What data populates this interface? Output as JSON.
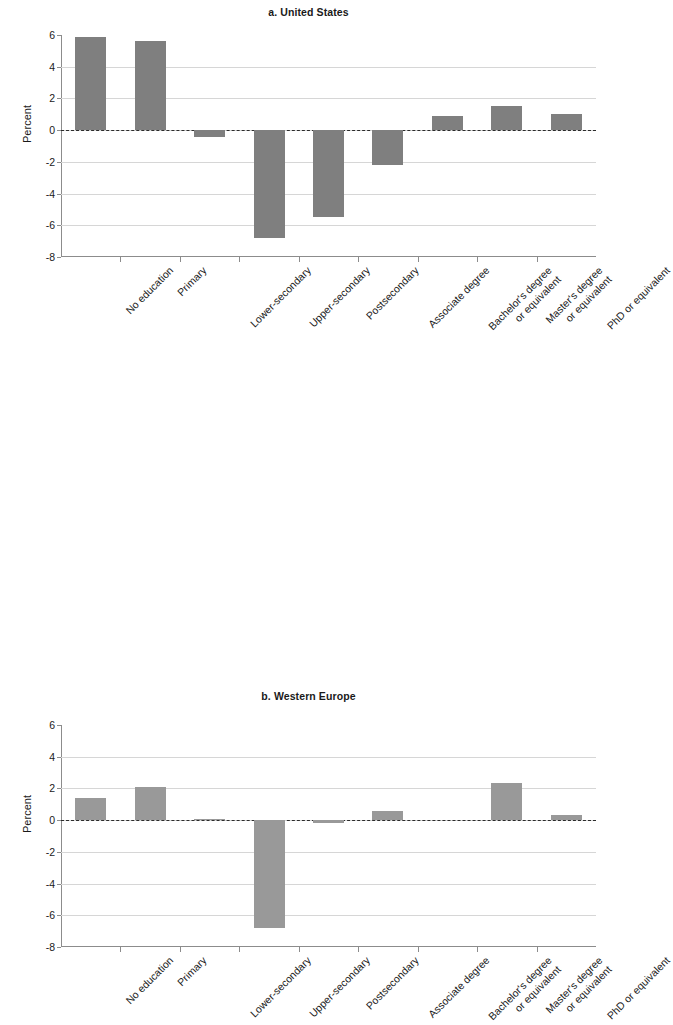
{
  "figure": {
    "ylabel": "Percent",
    "yticks": [
      6,
      4,
      2,
      0,
      -2,
      -4,
      -6,
      -8
    ],
    "ytick_labels": [
      "6",
      "4",
      "2",
      "0",
      "-2",
      "-4",
      "-6",
      "-8"
    ],
    "bar_color_a": "#7f7f7f",
    "bar_color_b": "#999999",
    "gridline_color": "#d6d6d6",
    "axis_color": "#8c8c8c",
    "zeroline_color": "#2b2b2b"
  },
  "categories": [
    {
      "lines": [
        "No education"
      ]
    },
    {
      "lines": [
        "Primary"
      ]
    },
    {
      "lines": [
        "Lower-secondary"
      ]
    },
    {
      "lines": [
        "Upper-secondary"
      ]
    },
    {
      "lines": [
        "Postsecondary"
      ]
    },
    {
      "lines": [
        "Associate degree"
      ]
    },
    {
      "lines": [
        "Bachelor's degree",
        "or equivalent"
      ]
    },
    {
      "lines": [
        "Master's degree",
        "or equivalent"
      ]
    },
    {
      "lines": [
        "PhD or equivalent"
      ]
    }
  ],
  "chart_data": [
    {
      "type": "bar",
      "title": "a. United States",
      "xlabel": "",
      "ylabel": "Percent",
      "ylim": [
        -8,
        6
      ],
      "yticks": [
        6,
        4,
        2,
        0,
        -2,
        -4,
        -6,
        -8
      ],
      "grid": true,
      "legend": "none",
      "bar_color": "#7f7f7f",
      "categories": [
        "No education",
        "Primary",
        "Lower-secondary",
        "Upper-secondary",
        "Postsecondary",
        "Associate degree",
        "Bachelor's degree or equivalent",
        "Master's degree or equivalent",
        "PhD or equivalent"
      ],
      "values": [
        5.9,
        5.6,
        -0.45,
        -6.8,
        -5.5,
        -2.2,
        0.9,
        1.5,
        1.0
      ]
    },
    {
      "type": "bar",
      "title": "b. Western Europe",
      "xlabel": "",
      "ylabel": "Percent",
      "ylim": [
        -8,
        6
      ],
      "yticks": [
        6,
        4,
        2,
        0,
        -2,
        -4,
        -6,
        -8
      ],
      "grid": true,
      "legend": "none",
      "bar_color": "#999999",
      "categories": [
        "No education",
        "Primary",
        "Lower-secondary",
        "Upper-secondary",
        "Postsecondary",
        "Associate degree",
        "Bachelor's degree or equivalent",
        "Master's degree or equivalent",
        "PhD or equivalent"
      ],
      "values": [
        1.4,
        2.1,
        0.05,
        -6.8,
        -0.2,
        0.6,
        0.0,
        2.35,
        0.35
      ]
    }
  ]
}
